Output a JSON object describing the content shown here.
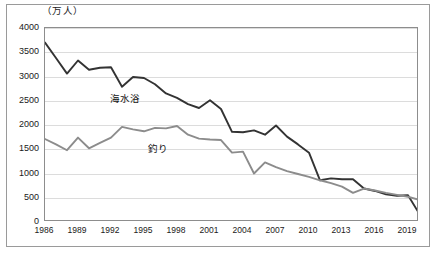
{
  "unit_label": "（万人）",
  "axis": {
    "y_ticks": [
      "0",
      "500",
      "1000",
      "1500",
      "2000",
      "2500",
      "3000",
      "3500",
      "4000"
    ],
    "x_ticks": [
      "1986",
      "1989",
      "1992",
      "1995",
      "1998",
      "2001",
      "2004",
      "2007",
      "2010",
      "2013",
      "2016",
      "2019"
    ]
  },
  "labels": {
    "seawater_bathing": "海水浴",
    "fishing": "釣り"
  },
  "colors": {
    "seawater_bathing": "#333333",
    "fishing": "#8c8c8c",
    "gridline": "#dcdcdc",
    "frame": "#8d8d8d"
  },
  "chart_data": {
    "type": "line",
    "title": "",
    "subtitle": "",
    "xlabel": "",
    "ylabel": "（万人）",
    "ylim": [
      0,
      4000
    ],
    "xlim": [
      1986,
      2020
    ],
    "ytick_step": 500,
    "xtick_step": 3,
    "grid": true,
    "legend": "inline-annotations",
    "x": [
      1986,
      1987,
      1988,
      1989,
      1990,
      1991,
      1992,
      1993,
      1994,
      1995,
      1996,
      1997,
      1998,
      1999,
      2000,
      2001,
      2002,
      2003,
      2004,
      2005,
      2006,
      2007,
      2008,
      2009,
      2010,
      2011,
      2012,
      2013,
      2014,
      2015,
      2016,
      2017,
      2018,
      2019,
      2020
    ],
    "series": [
      {
        "name": "海水浴",
        "color": "#333333",
        "values": [
          3700,
          3380,
          3060,
          3330,
          3140,
          3180,
          3190,
          2790,
          2990,
          2970,
          2840,
          2650,
          2560,
          2430,
          2350,
          2510,
          2330,
          1860,
          1850,
          1890,
          1800,
          1990,
          1760,
          1600,
          1430,
          860,
          900,
          880,
          880,
          690,
          640,
          570,
          540,
          550,
          180
        ]
      },
      {
        "name": "釣り",
        "color": "#8c8c8c",
        "values": [
          1710,
          1600,
          1480,
          1740,
          1520,
          1630,
          1740,
          1960,
          1910,
          1870,
          1940,
          1930,
          1980,
          1800,
          1720,
          1700,
          1690,
          1430,
          1450,
          1000,
          1230,
          1130,
          1050,
          990,
          930,
          860,
          800,
          730,
          600,
          690,
          650,
          600,
          560,
          520,
          460
        ]
      }
    ],
    "annotations": [
      {
        "text": "海水浴",
        "x": 1995,
        "y": 2600
      },
      {
        "text": "釣り",
        "x": 1998,
        "y": 1550
      }
    ]
  }
}
